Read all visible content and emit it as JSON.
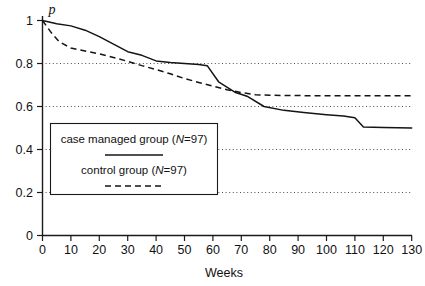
{
  "chart_data": {
    "type": "line",
    "title": "",
    "xlabel": "Weeks",
    "ylabel": "p",
    "xlim": [
      0,
      133
    ],
    "ylim": [
      0,
      1.06
    ],
    "xticks": [
      0,
      10,
      20,
      30,
      40,
      50,
      60,
      70,
      80,
      90,
      100,
      110,
      120,
      130
    ],
    "xtick_labels": [
      "0",
      "10",
      "20",
      "30",
      "40",
      "50",
      "60",
      "70",
      "80",
      "90",
      "100",
      "110",
      "120",
      "130"
    ],
    "yticks": [
      0,
      0.2,
      0.4,
      0.6,
      0.8,
      1
    ],
    "ytick_labels": [
      "0",
      "0.2",
      "0.4",
      "0.6",
      "0.8",
      "1"
    ],
    "gridlines_y": [
      0.2,
      0.4,
      0.6,
      0.8
    ],
    "grid": "horizontal-dotted",
    "legend_position": "center-left-inside",
    "series": [
      {
        "name": "case managed group (N=97)",
        "style": "solid",
        "label_text": "case managed group (",
        "label_italic": "N",
        "label_tail": "=97)",
        "x": [
          0,
          5,
          10,
          15,
          20,
          25,
          30,
          35,
          40,
          45,
          50,
          55,
          58,
          62,
          68,
          72,
          78,
          85,
          92,
          100,
          106,
          110,
          113,
          120,
          130
        ],
        "y": [
          1.0,
          0.985,
          0.975,
          0.955,
          0.925,
          0.89,
          0.855,
          0.838,
          0.812,
          0.805,
          0.8,
          0.795,
          0.79,
          0.715,
          0.665,
          0.648,
          0.6,
          0.582,
          0.572,
          0.562,
          0.556,
          0.548,
          0.505,
          0.502,
          0.5
        ]
      },
      {
        "name": "control group (N=97)",
        "style": "dashed",
        "label_text": "control group (",
        "label_italic": "N",
        "label_tail": "=97)",
        "x": [
          0,
          3,
          6,
          10,
          15,
          20,
          25,
          30,
          35,
          40,
          45,
          50,
          55,
          60,
          65,
          70,
          75,
          80,
          88,
          95,
          105,
          115,
          125,
          130
        ],
        "y": [
          1.0,
          0.945,
          0.9,
          0.872,
          0.858,
          0.845,
          0.828,
          0.81,
          0.79,
          0.772,
          0.752,
          0.73,
          0.712,
          0.695,
          0.678,
          0.665,
          0.655,
          0.652,
          0.651,
          0.65,
          0.65,
          0.65,
          0.65,
          0.65
        ]
      }
    ]
  }
}
